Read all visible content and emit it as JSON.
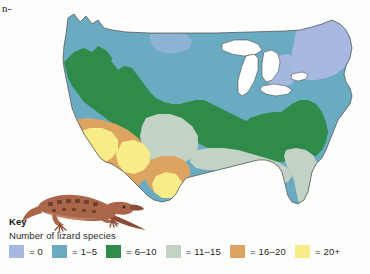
{
  "page": {
    "cropped_running_text": "n-"
  },
  "legend": {
    "title": "Key",
    "subtitle": "Number of lizard species",
    "items": [
      {
        "label": "= 0",
        "range": "0",
        "color": "#a7b9e0"
      },
      {
        "label": "= 1–5",
        "range": "1–5",
        "color": "#6aabc2"
      },
      {
        "label": "= 6–10",
        "range": "6–10",
        "color": "#2e8b49"
      },
      {
        "label": "= 11–15",
        "range": "11–15",
        "color": "#c2d2c4"
      },
      {
        "label": "= 16–20",
        "range": "16–20",
        "color": "#dda361"
      },
      {
        "label": "= 20+",
        "range": "20+",
        "color": "#f7ec87"
      }
    ]
  },
  "map": {
    "name": "united-states-lizard-species-richness-map",
    "description": "Map of the contiguous United States shaded by number of lizard species",
    "colors": {
      "zero": "#a7b9e0",
      "one_to_five": "#6aabc2",
      "six_to_ten": "#2e8b49",
      "eleven_to_fifteen": "#c2d2c4",
      "sixteen_to_twenty": "#dda361",
      "twenty_plus": "#f7ec87",
      "lake": "#ffffff",
      "outline": "#3a3a3a",
      "background": "#fdfdfb"
    },
    "regions": [
      {
        "name": "new-england-northeast",
        "class": "= 0"
      },
      {
        "name": "northern-great-plains",
        "class": "= 0"
      },
      {
        "name": "northern-tier-great-lakes",
        "class": "= 1–5"
      },
      {
        "name": "pacific-northwest-coast",
        "class": "= 1–5"
      },
      {
        "name": "appalachian-interior-highlands",
        "class": "= 6–10"
      },
      {
        "name": "southeast-interior",
        "class": "= 6–10"
      },
      {
        "name": "florida-gulf-coastal-plain",
        "class": "= 11–15"
      },
      {
        "name": "great-basin-colorado-plateau",
        "class": "= 16–20"
      },
      {
        "name": "sonoran-chihuahuan-desert",
        "class": "= 20+"
      }
    ]
  },
  "lizard": {
    "name": "lizard-illustration",
    "colors": {
      "body": "#a9664a",
      "body_shadow": "#8a4a34",
      "belly": "#c98a6b",
      "spots": "#6d3826"
    }
  }
}
